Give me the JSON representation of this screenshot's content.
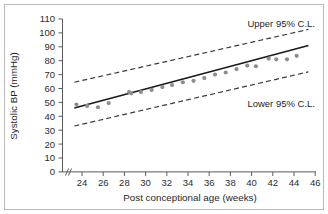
{
  "chart_data": {
    "type": "scatter",
    "title": "",
    "xlabel": "Post conceptional age (weeks)",
    "ylabel": "Systolic BP (mmHg)",
    "xlim": [
      23,
      46.6
    ],
    "ylim": [
      0,
      110
    ],
    "x_ticks": [
      24,
      26,
      28,
      30,
      32,
      34,
      36,
      38,
      40,
      42,
      44,
      46
    ],
    "y_ticks": [
      110,
      100,
      90,
      80,
      70,
      60,
      50,
      40,
      30,
      20,
      10,
      0
    ],
    "grid": false,
    "axis_break": "//",
    "legend_position": "none",
    "annotations": [
      {
        "text": "Upper 95% C.L.",
        "x": 41.5,
        "y": 103
      },
      {
        "text": "Lower 95% C.L.",
        "x": 41.5,
        "y": 54
      }
    ],
    "series": [
      {
        "name": "Observed systolic BP",
        "type": "scatter",
        "marker": "circle",
        "color": "#8e8e8e",
        "x": [
          24.3,
          25.3,
          26.3,
          27.3,
          29.2,
          29.4,
          30.3,
          31.3,
          32.3,
          33.2,
          34.2,
          35.2,
          36.2,
          37.2,
          38.2,
          39.2,
          40.2,
          41.0,
          42.2,
          42.9,
          43.9,
          44.8
        ],
        "values": [
          48.5,
          47.5,
          46.5,
          49.5,
          57.5,
          56.5,
          57.5,
          59.0,
          61.0,
          62.5,
          64.5,
          65.5,
          67.5,
          70.0,
          71.5,
          74.0,
          76.5,
          76.0,
          81.5,
          81.0,
          81.0,
          83.5
        ]
      },
      {
        "name": "Regression line",
        "type": "line",
        "color": "#1a1a1a",
        "x": [
          24.1,
          45.9
        ],
        "values": [
          46.0,
          91.0
        ]
      },
      {
        "name": "Upper 95% C.L.",
        "type": "line",
        "style": "dashed",
        "color": "#3a3a3a",
        "x": [
          24.1,
          45.9
        ],
        "values": [
          64.5,
          102.5
        ]
      },
      {
        "name": "Lower 95% C.L.",
        "type": "line",
        "style": "dashed",
        "color": "#3a3a3a",
        "x": [
          24.1,
          45.9
        ],
        "values": [
          33.0,
          72.0
        ]
      }
    ]
  },
  "figure": {
    "border_color": "#b9b9b9",
    "background": "#ffffff"
  }
}
